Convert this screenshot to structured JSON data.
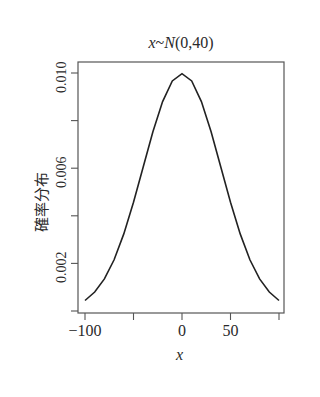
{
  "chart_data": {
    "type": "line",
    "title": "x~N(0,40)",
    "title_parts": {
      "var": "x",
      "tilde": "~",
      "dist": "N",
      "params": "(0,40)"
    },
    "xlabel": "x",
    "ylabel": "確率分布",
    "xlim": [
      -100,
      100
    ],
    "ylim": [
      0.0,
      0.0104
    ],
    "x_ticks": [
      -100,
      -50,
      0,
      50,
      100
    ],
    "x_tick_labels": [
      "−100",
      "",
      "0",
      "50",
      ""
    ],
    "y_ticks": [
      0.0,
      0.002,
      0.004,
      0.006,
      0.008,
      0.01
    ],
    "y_tick_labels": [
      "",
      "0.002",
      "",
      "0.006",
      "",
      "0.010"
    ],
    "grid": false,
    "legend": null,
    "series": [
      {
        "name": "normal density mean 0 sd 40",
        "x": [
          -100,
          -90,
          -80,
          -70,
          -60,
          -50,
          -40,
          -30,
          -20,
          -10,
          0,
          10,
          20,
          30,
          40,
          50,
          60,
          70,
          80,
          90,
          100
        ],
        "values": [
          0.00044,
          0.0008,
          0.00135,
          0.00215,
          0.00324,
          0.00457,
          0.00605,
          0.00753,
          0.0088,
          0.00967,
          0.00997,
          0.00967,
          0.0088,
          0.00753,
          0.00605,
          0.00457,
          0.00324,
          0.00215,
          0.00135,
          0.0008,
          0.00044
        ]
      }
    ]
  }
}
